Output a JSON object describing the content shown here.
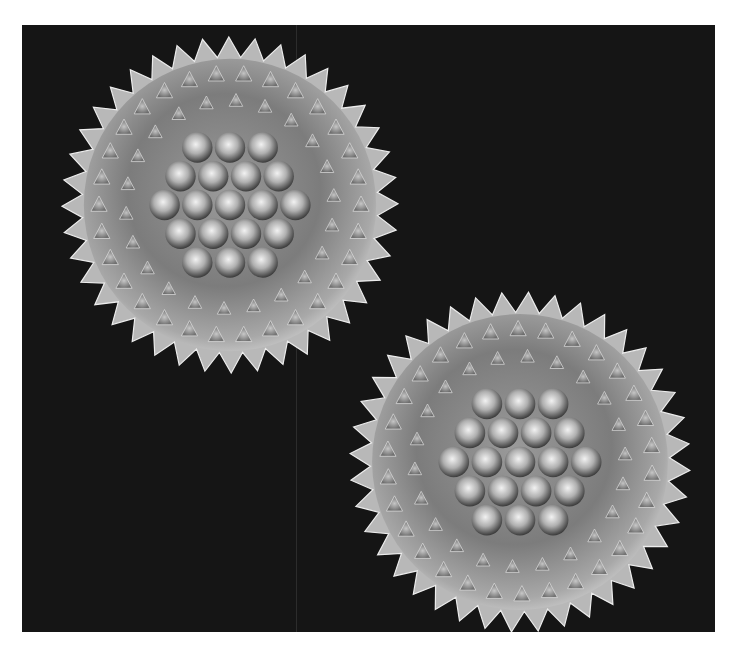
{
  "image": {
    "subject": "SEM micrograph of two echinate pollen grains",
    "background_color": "#151515",
    "page_margin_color": "#ffffff",
    "grains": [
      {
        "name": "upper-left-grain",
        "cx": 208,
        "cy": 180,
        "r": 168,
        "spines": 40,
        "tilt": 0.15
      },
      {
        "name": "lower-right-grain",
        "cx": 498,
        "cy": 437,
        "r": 170,
        "spines": 40,
        "tilt": 0.05
      }
    ],
    "highlight_color": "#e8e8e8",
    "shadow_color": "#3a3a3a"
  }
}
